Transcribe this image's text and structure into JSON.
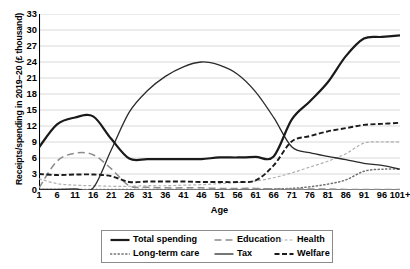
{
  "chart_data": {
    "type": "line",
    "title": "",
    "xlabel": "Age",
    "ylabel": "Receipts/spending in 2019–20 (£ thousand)",
    "ylim": [
      0,
      33
    ],
    "yticks": [
      0,
      3,
      6,
      9,
      12,
      15,
      18,
      21,
      24,
      27,
      30,
      33
    ],
    "xticks": [
      "1",
      "6",
      "11",
      "16",
      "21",
      "26",
      "31",
      "36",
      "41",
      "46",
      "51",
      "56",
      "61",
      "66",
      "71",
      "76",
      "81",
      "86",
      "91",
      "96",
      "101+"
    ],
    "grid": true,
    "legend_position": "bottom",
    "x": [
      1,
      6,
      11,
      16,
      21,
      26,
      31,
      36,
      41,
      46,
      51,
      56,
      61,
      66,
      71,
      76,
      81,
      86,
      91,
      96,
      101
    ],
    "series": [
      {
        "name": "Total spending",
        "style": "solid-thick",
        "color": "#1a1a1a",
        "values": [
          8.0,
          12.3,
          13.6,
          13.8,
          9.6,
          5.9,
          5.8,
          5.8,
          5.8,
          5.8,
          6.1,
          6.1,
          6.2,
          6.3,
          13.2,
          16.6,
          20.2,
          25.1,
          28.4,
          28.7,
          29.0
        ]
      },
      {
        "name": "Education",
        "style": "long-dash",
        "color": "#8c8c8c",
        "values": [
          0.4,
          5.4,
          6.9,
          6.6,
          4.0,
          0.8,
          0.5,
          0.4,
          0.4,
          0.4,
          0.3,
          0.3,
          0.3,
          0.2,
          0.2,
          0.2,
          0.2,
          0.1,
          0.1,
          0.1,
          0.1
        ]
      },
      {
        "name": "Health",
        "style": "fine-dash",
        "color": "#b0b0b0",
        "values": [
          2.1,
          1.2,
          0.9,
          0.8,
          0.7,
          0.7,
          0.8,
          0.8,
          0.9,
          1.0,
          1.2,
          1.4,
          1.7,
          2.3,
          3.2,
          4.3,
          5.4,
          6.8,
          8.8,
          9.0,
          9.0
        ]
      },
      {
        "name": "Long-term care",
        "style": "dotted",
        "color": "#707070",
        "values": [
          0.1,
          0.1,
          0.1,
          0.1,
          0.1,
          0.1,
          0.1,
          0.1,
          0.1,
          0.1,
          0.1,
          0.1,
          0.1,
          0.2,
          0.3,
          0.6,
          1.1,
          1.9,
          3.5,
          3.9,
          3.9
        ]
      },
      {
        "name": "Tax",
        "style": "solid-thin",
        "color": "#2b2b2b",
        "values": [
          0.1,
          0.1,
          0.2,
          0.4,
          7.5,
          14.6,
          18.6,
          21.3,
          23.1,
          24.0,
          23.4,
          21.7,
          18.4,
          13.6,
          8.1,
          7.0,
          6.3,
          5.7,
          5.0,
          4.6,
          3.9
        ]
      },
      {
        "name": "Welfare",
        "style": "dash",
        "color": "#1a1a1a",
        "values": [
          3.0,
          2.8,
          2.9,
          2.9,
          2.6,
          1.5,
          1.6,
          1.6,
          1.6,
          1.5,
          1.5,
          1.5,
          1.8,
          4.6,
          9.1,
          10.1,
          11.0,
          11.6,
          12.2,
          12.4,
          12.6
        ]
      }
    ]
  },
  "legend": {
    "items": [
      {
        "label": "Total spending",
        "icon": "solid-thick-line-swatch"
      },
      {
        "label": "Education",
        "icon": "long-dash-line-swatch"
      },
      {
        "label": "Health",
        "icon": "fine-dash-line-swatch"
      },
      {
        "label": "Long-term care",
        "icon": "dotted-line-swatch"
      },
      {
        "label": "Tax",
        "icon": "solid-thin-line-swatch"
      },
      {
        "label": "Welfare",
        "icon": "dash-line-swatch"
      }
    ]
  }
}
